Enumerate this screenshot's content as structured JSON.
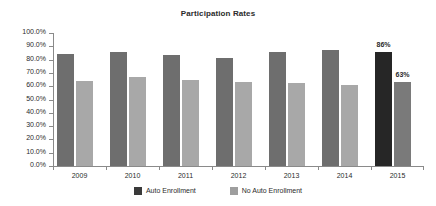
{
  "chart_data": {
    "type": "bar",
    "title": "Participation Rates",
    "xlabel": "",
    "ylabel": "",
    "ylim": [
      0,
      100
    ],
    "grid": false,
    "legend_position": "bottom",
    "categories": [
      "2009",
      "2010",
      "2011",
      "2012",
      "2013",
      "2014",
      "2015"
    ],
    "ytick_labels": [
      "100.0%",
      "90.0%",
      "80.0%",
      "70.0%",
      "60.0%",
      "50.0%",
      "40.0%",
      "30.0%",
      "20.0%",
      "10.0%",
      "0.0%"
    ],
    "ytick_values": [
      100,
      90,
      80,
      70,
      60,
      50,
      40,
      30,
      20,
      10,
      0
    ],
    "series": [
      {
        "name": "Auto Enrollment",
        "color": "#6e6e6e",
        "highlight_color": "#262626",
        "values": [
          84,
          85.5,
          83.5,
          81.5,
          86,
          87,
          86
        ],
        "bars": [
          {
            "category": "2009",
            "value": 84,
            "label": "",
            "highlight": false
          },
          {
            "category": "2010",
            "value": 85.5,
            "label": "",
            "highlight": false
          },
          {
            "category": "2011",
            "value": 83.5,
            "label": "",
            "highlight": false
          },
          {
            "category": "2012",
            "value": 81.5,
            "label": "",
            "highlight": false
          },
          {
            "category": "2013",
            "value": 86,
            "label": "",
            "highlight": false
          },
          {
            "category": "2014",
            "value": 87,
            "label": "",
            "highlight": false
          },
          {
            "category": "2015",
            "value": 86,
            "label": "86%",
            "highlight": true
          }
        ]
      },
      {
        "name": "No Auto Enrollment",
        "color": "#a8a8a8",
        "highlight_color": "#7a7a7a",
        "values": [
          64,
          67,
          64.5,
          63,
          62.5,
          61,
          63
        ],
        "bars": [
          {
            "category": "2009",
            "value": 64,
            "label": "",
            "highlight": false
          },
          {
            "category": "2010",
            "value": 67,
            "label": "",
            "highlight": false
          },
          {
            "category": "2011",
            "value": 64.5,
            "label": "",
            "highlight": false
          },
          {
            "category": "2012",
            "value": 63,
            "label": "",
            "highlight": false
          },
          {
            "category": "2013",
            "value": 62.5,
            "label": "",
            "highlight": false
          },
          {
            "category": "2014",
            "value": 61,
            "label": "",
            "highlight": false
          },
          {
            "category": "2015",
            "value": 63,
            "label": "63%",
            "highlight": true
          }
        ]
      }
    ],
    "annotations": [
      {
        "text": "86%",
        "category": "2015",
        "series": "Auto Enrollment"
      },
      {
        "text": "63%",
        "category": "2015",
        "series": "No Auto Enrollment"
      }
    ]
  }
}
